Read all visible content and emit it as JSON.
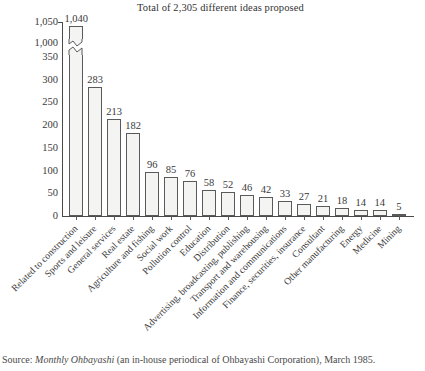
{
  "chart_data": {
    "type": "bar",
    "title": "Total of 2,305 different ideas proposed",
    "xlabel": "",
    "ylabel": "",
    "ylim": [
      0,
      1050
    ],
    "grid": false,
    "legend": "none",
    "axis_break": {
      "present": true,
      "between": [
        350,
        1000
      ],
      "note": "y-axis scale breaks between 350 and 1,000; tallest bar drawn with a zigzag break"
    },
    "ytick_labels": [
      "0",
      "50",
      "100",
      "150",
      "200",
      "250",
      "300",
      "350",
      "1,000",
      "1,050"
    ],
    "ytick_values": [
      0,
      50,
      100,
      150,
      200,
      250,
      300,
      350,
      1000,
      1050
    ],
    "categories": [
      "Related to construction",
      "Sports and leisure",
      "General services",
      "Real estate",
      "Agriculture and fishing",
      "Social work",
      "Pollution control",
      "Education",
      "Distribution",
      "Advertising, broadcasting, publishing",
      "Transport and warehousing",
      "Information and communications",
      "Finance, securities, insurance",
      "Consultant",
      "Other manufacturing",
      "Energy",
      "Medicine",
      "Mining"
    ],
    "values": [
      1040,
      283,
      213,
      182,
      96,
      85,
      76,
      58,
      52,
      46,
      42,
      33,
      27,
      21,
      18,
      14,
      14,
      5
    ],
    "value_labels": [
      "1,040",
      "283",
      "213",
      "182",
      "96",
      "85",
      "76",
      "58",
      "52",
      "46",
      "42",
      "33",
      "27",
      "21",
      "18",
      "14",
      "14",
      "5"
    ],
    "bar_fill_color": "#f4f4f2",
    "bar_edge_color": "#5a5a5a",
    "text_color": "#3a3a3a"
  },
  "source": {
    "prefix": "Source:",
    "italic_part": "Monthly Ohbayashi",
    "rest": "(an in-house periodical of Ohbayashi Corporation), March 1985."
  }
}
